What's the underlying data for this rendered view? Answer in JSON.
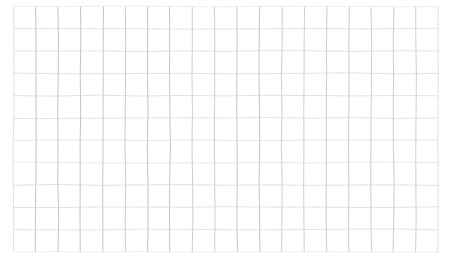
{
  "image": {
    "kind": "scanned-graph-paper-grid",
    "width": 454,
    "height": 266,
    "background_color": "#ffffff",
    "alt_text": "A blank scanned sheet of graph paper: a faint light-gray rectangular grid of ruled lines on white, with no text, labels, numbers or drawn content."
  },
  "grid": {
    "columns": 19,
    "rows": 11,
    "origin_x": 13.5,
    "origin_y": 6.5,
    "cell_width": 22.36,
    "cell_height": 22.3,
    "line_color": "#b9b9bd",
    "line_color_light": "#d8d8dc",
    "line_color_faint": "#e6e6ea",
    "vertical_line_width": 0.9,
    "horizontal_line_width": 0.8,
    "border_line_width": 0.9,
    "jitter_amplitude_px": 0.55,
    "note": "Scanned paper: vertical rules read slightly darker than horizontals, and every line wobbles by well under a pixel."
  },
  "content": {
    "text_items": [],
    "data_marks": [],
    "annotations": []
  }
}
